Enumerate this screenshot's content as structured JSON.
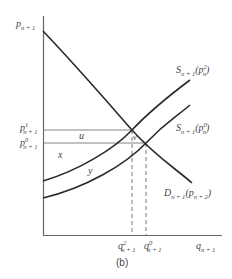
{
  "figure": {
    "caption": "(b)",
    "y_axis": {
      "symbol": "p",
      "sub": "n + 1"
    },
    "x_axis": {
      "symbol": "q",
      "sub": "n + 1"
    },
    "price_labels": [
      {
        "symbol": "p",
        "sup": "1",
        "sub": "n + 1"
      },
      {
        "symbol": "p",
        "sup": "0",
        "sub": "n + 1"
      }
    ],
    "quantity_labels": [
      {
        "symbol": "q",
        "sup": "2",
        "sub": "n + 1"
      },
      {
        "symbol": "q",
        "sup": "0",
        "sub": "n + 1"
      }
    ],
    "curves": {
      "supply_upper": {
        "symbol": "S",
        "sub": "n + 1",
        "arg": "(p",
        "arg_sup": "2",
        "arg_sub": "n",
        "close": ")"
      },
      "supply_lower": {
        "symbol": "S",
        "sub": "n + 1",
        "arg": "(p",
        "arg_sup": "0",
        "arg_sub": "n",
        "close": ")"
      },
      "demand": {
        "symbol": "D",
        "sub": "n + 1",
        "arg": "(p",
        "arg_sub": "n + 2",
        "close": ")"
      }
    },
    "regions": {
      "u": "u",
      "v": "v",
      "x": "x",
      "y": "y"
    },
    "colors": {
      "line": "#2a2a2a",
      "axis": "#555555",
      "guide": "#666666"
    }
  }
}
